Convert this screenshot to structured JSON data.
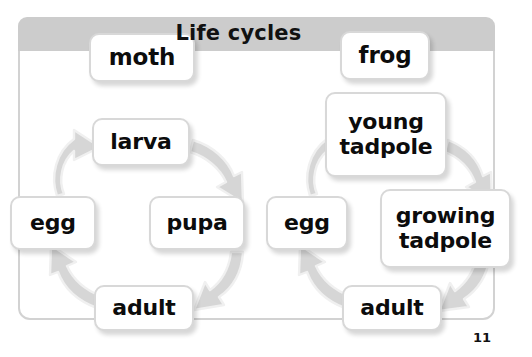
{
  "header": {
    "title": "Life cycles"
  },
  "page": {
    "number": "11"
  },
  "colors": {
    "titlebar_gray": "#cccccc",
    "frame_border": "#d2d2d2",
    "arrow_fill": "#d6d6d6",
    "arrow_stroke": "#ececec",
    "box_border": "#d8d8d8",
    "box_fill": "#ffffff",
    "text": "#0c0c0c"
  },
  "diagram": {
    "type": "cycle-diagram",
    "cycles": [
      {
        "name": "moth-life-cycle",
        "heading": "moth",
        "stages": [
          "egg",
          "larva",
          "pupa",
          "adult"
        ],
        "flow": "egg → larva → pupa → adult → egg"
      },
      {
        "name": "frog-life-cycle",
        "heading": "frog",
        "stages": [
          "egg",
          "young tadpole",
          "growing tadpole",
          "adult"
        ],
        "flow": "egg → young tadpole → growing tadpole → adult → egg"
      }
    ]
  },
  "nodes": {
    "moth_title": "moth",
    "moth_larva": "larva",
    "moth_egg": "egg",
    "moth_pupa": "pupa",
    "moth_adult": "adult",
    "frog_title": "frog",
    "frog_young_tadpole": "young\ntadpole",
    "frog_egg": "egg",
    "frog_growing_tadpole": "growing\ntadpole",
    "frog_adult": "adult"
  }
}
